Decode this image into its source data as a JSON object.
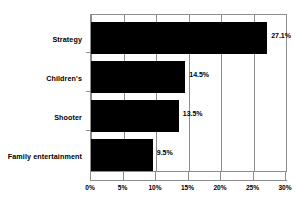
{
  "chart_data": {
    "type": "bar",
    "orientation": "horizontal",
    "title": "",
    "subtitle": "",
    "xlabel": "",
    "ylabel": "",
    "categories": [
      "Strategy",
      "Children's",
      "Shooter",
      "Family entertainment"
    ],
    "values": [
      27.1,
      14.5,
      13.5,
      9.5
    ],
    "value_labels": [
      "27.1%",
      "14.5%",
      "13.5%",
      "9.5%"
    ],
    "xlim": [
      0,
      30
    ],
    "xticks": [
      0,
      5,
      10,
      15,
      20,
      25,
      30
    ],
    "xtick_labels": [
      "0%",
      "5%",
      "10%",
      "15%",
      "20%",
      "25%",
      "30%"
    ],
    "grid": true,
    "grid_axis": "x",
    "legend": false,
    "legend_position": "none",
    "bar_color": "#000000",
    "axis_color": "#8d8d8d",
    "background_color": "#ffffff",
    "text_color": "#000000"
  }
}
